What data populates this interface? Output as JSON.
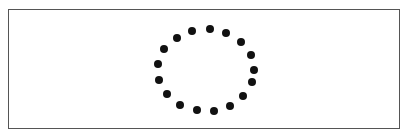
{
  "figure": {
    "dot_color": "#111111",
    "frame_color": "#555555",
    "dot_radius": 4,
    "dots": [
      [
        210,
        29
      ],
      [
        226,
        33
      ],
      [
        241,
        42
      ],
      [
        251,
        55
      ],
      [
        254,
        70
      ],
      [
        252,
        82
      ],
      [
        243,
        96
      ],
      [
        230,
        106
      ],
      [
        214,
        111
      ],
      [
        197,
        110
      ],
      [
        180,
        105
      ],
      [
        167,
        94
      ],
      [
        159,
        80
      ],
      [
        158,
        64
      ],
      [
        164,
        49
      ],
      [
        177,
        38
      ],
      [
        192,
        31
      ]
    ]
  }
}
